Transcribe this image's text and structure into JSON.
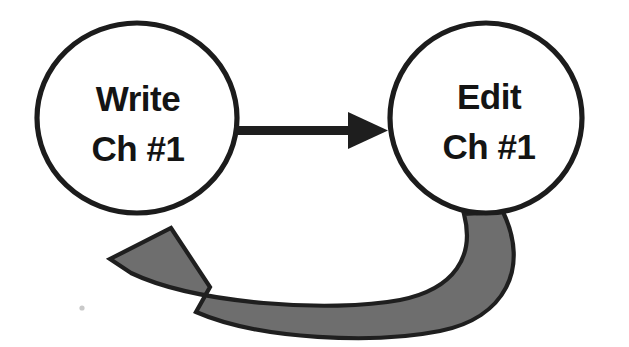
{
  "canvas": {
    "width": 629,
    "height": 347,
    "background_color": "#ffffff"
  },
  "diagram": {
    "type": "cycle-flow-diagram",
    "title": "",
    "nodes": [
      {
        "id": "write",
        "shape": "ellipse",
        "line1": "Write",
        "line2": "Ch #1",
        "center_x": 137,
        "center_y": 118,
        "radius_x": 100,
        "radius_y": 95,
        "fill_color": "#ffffff",
        "stroke_color": "#1c1c1c"
      },
      {
        "id": "edit",
        "shape": "ellipse",
        "line1": "Edit",
        "line2": "Ch #1",
        "center_x": 486,
        "center_y": 118,
        "radius_x": 96,
        "radius_y": 95,
        "fill_color": "#ffffff",
        "stroke_color": "#1c1c1c"
      }
    ],
    "edges": [
      {
        "id": "write-to-edit",
        "from": "write",
        "to": "edit",
        "label": "",
        "style": "straight",
        "color": "#1e1e1e",
        "direction": "right"
      },
      {
        "id": "edit-to-write",
        "from": "edit",
        "to": "write",
        "label": "",
        "style": "curved-ribbon",
        "color": "#6e6e6e",
        "outline_color": "#1f1f1f",
        "direction": "counterclockwise-return"
      }
    ]
  }
}
